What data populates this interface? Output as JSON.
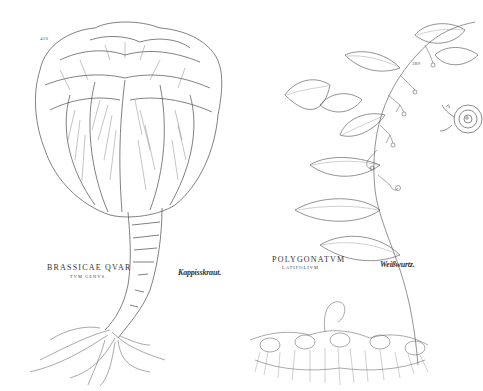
{
  "plates": [
    {
      "page_number": "410",
      "latin_name": "BRASSICAE QVAR",
      "latin_subtitle": "TVM GENVS.",
      "german_name": "Kappisskraut.",
      "subject": "cabbage-head-with-stalk-and-roots"
    },
    {
      "page_number": "389",
      "latin_name": "POLYGONATVM",
      "latin_subtitle": "LATIFOLIVM",
      "german_name": "Weißwurtz.",
      "subject": "solomons-seal-with-leaves-flowers-and-rhizome"
    }
  ],
  "ornament": {
    "type": "spiral-flourish",
    "position": "right-edge"
  },
  "colors": {
    "paper": "#ffffff",
    "ink": "#3a3a3a",
    "ornament_ink": "#8a8a8a"
  }
}
